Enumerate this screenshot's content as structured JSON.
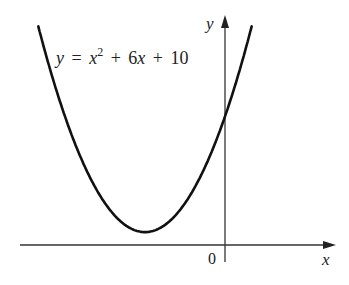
{
  "chart_data": {
    "type": "line",
    "title": "",
    "equation": {
      "lhs": "y",
      "eq": "=",
      "x_term": "x",
      "exp": "2",
      "plus1": "+",
      "linear": "6",
      "linear_var": "x",
      "plus2": "+",
      "constant": "10"
    },
    "equation_text": "y = x^2 + 6x + 10",
    "xlabel": "x",
    "ylabel": "y",
    "origin_label": "0",
    "series": [
      {
        "name": "y = x^2 + 6x + 10",
        "x": [
          -6,
          -5,
          -4,
          -3,
          -2,
          -1,
          0,
          1
        ],
        "values": [
          10,
          5,
          2,
          1,
          2,
          5,
          10,
          17
        ]
      }
    ],
    "vertex": {
      "x": -3,
      "y": 1
    },
    "y_intercept": 10,
    "xlim": [
      -7.1,
      4.1
    ],
    "ylim": [
      -2,
      18
    ],
    "grid": false,
    "legend": "none",
    "tick_labels": false
  },
  "colors": {
    "curve": "#111111",
    "axes": "#333333",
    "background": "#ffffff"
  }
}
